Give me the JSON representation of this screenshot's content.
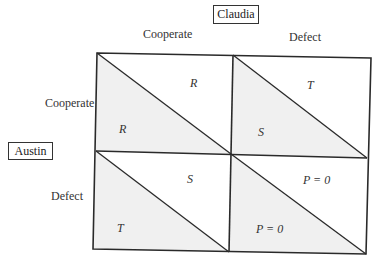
{
  "players": {
    "column": "Claudia",
    "row": "Austin"
  },
  "column_strategies": [
    "Cooperate",
    "Defect"
  ],
  "row_strategies": [
    "Cooperate",
    "Defect"
  ],
  "cells": [
    {
      "row": "Cooperate",
      "col": "Cooperate",
      "row_payoff": "R",
      "col_payoff": "R"
    },
    {
      "row": "Cooperate",
      "col": "Defect",
      "row_payoff": "S",
      "col_payoff": "T"
    },
    {
      "row": "Defect",
      "col": "Cooperate",
      "row_payoff": "T",
      "col_payoff": "S"
    },
    {
      "row": "Defect",
      "col": "Defect",
      "row_payoff": "P = 0",
      "col_payoff": "P = 0"
    }
  ],
  "colors": {
    "shaded": "#f0f0f0",
    "line": "#2a2a2a",
    "background": "#ffffff"
  }
}
